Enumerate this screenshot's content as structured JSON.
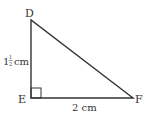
{
  "diagram": {
    "type": "right-triangle",
    "vertices": {
      "D": {
        "label": "D"
      },
      "E": {
        "label": "E"
      },
      "F": {
        "label": "F"
      }
    },
    "right_angle_at": "E",
    "sides": {
      "DE": {
        "label_whole": "1",
        "label_num": "1",
        "label_den": "2",
        "label_unit": "cm"
      },
      "EF": {
        "label": "2 cm"
      }
    },
    "colors": {
      "stroke": "#333333",
      "text": "#333333"
    }
  }
}
